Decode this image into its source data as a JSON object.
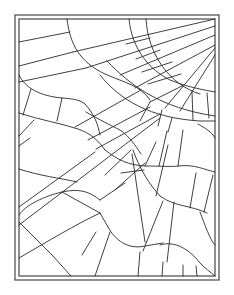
{
  "artwork": {
    "title": "",
    "colors": {
      "background": "#ffffff",
      "stroke": "#2a2a2a",
      "frame": "#555555"
    },
    "frame": {
      "outer": {
        "x": 15,
        "y": 15,
        "w": 204,
        "h": 265
      },
      "inner": {
        "x": 19,
        "y": 19,
        "w": 196,
        "h": 257
      }
    },
    "paths": [
      "M67 19 C70 45 80 62 105 74 C125 83 140 85 150 100",
      "M19 42 L70 32",
      "M19 66 L73 52",
      "M19 82 L86 68",
      "M73 52 L215 19",
      "M86 68 L215 26",
      "M19 75 C25 88 40 96 62 98 C75 99 80 100 85 104",
      "M31 89 L23 115",
      "M62 98 L57 121",
      "M19 113 C40 120 60 123 78 129 C90 133 98 140 105 150",
      "M85 104 C95 115 98 125 100 135",
      "M19 136 L34 120",
      "M19 146 L30 138",
      "M129 19 C132 50 150 70 170 80 C190 88 205 90 215 92",
      "M146 19 C148 55 170 85 200 94",
      "M126 44 L150 38",
      "M136 59 L160 50",
      "M142 72 L172 62",
      "M148 84 L181 74",
      "M107 61 C130 85 160 108 215 116",
      "M100 75 C120 100 150 118 200 121 L215 121",
      "M120 75 L215 35",
      "M135 88 L215 45",
      "M150 102 L182 86",
      "M165 108 L215 48",
      "M180 111 L215 55",
      "M192 92 L193 120",
      "M207 93 L209 118",
      "M150 102 L140 121",
      "M162 110 L158 126",
      "M172 118 L168 132",
      "M198 124 C205 128 212 132 215 138",
      "M75 127 L141 90",
      "M88 140 L150 107",
      "M96 149 L160 114",
      "M105 150 C118 160 128 165 145 166 C160 166 172 167 178 166 C195 164 205 170 215 172",
      "M86 112 C100 120 110 125 120 130 C130 137 135 145 141 154",
      "M19 169 C40 176 60 178 77 182",
      "M19 215 C25 205 45 196 62 192 C80 188 90 192 100 200",
      "M19 207 L95 152",
      "M19 225 L160 118",
      "M19 258 C50 240 75 225 100 213",
      "M19 222 L52 255",
      "M52 255 L71 276",
      "M62 192 L100 213",
      "M100 200 L125 183",
      "M100 213 L108 227",
      "M108 227 C115 240 128 250 145 246 L163 243",
      "M82 255 L96 232",
      "M95 276 L110 232",
      "M132 154 L145 242",
      "M144 170 L121 173",
      "M145 166 L156 142",
      "M159 166 L167 131",
      "M178 166 L183 130",
      "M133 150 C140 170 150 185 160 196 C175 207 190 205 207 213",
      "M156 196 L168 145",
      "M190 208 L196 173",
      "M204 212 L213 175",
      "M105 175 L131 150",
      "M115 190 L145 163",
      "M163 201 L143 251",
      "M174 202 L167 262",
      "M160 245 C175 240 190 250 200 263 C205 268 210 272 215 276",
      "M140 252 L138 276",
      "M163 262 L162 276",
      "M183 265 L183 276",
      "M196 266 L197 276",
      "M200 212 C205 225 210 240 215 245"
    ]
  }
}
